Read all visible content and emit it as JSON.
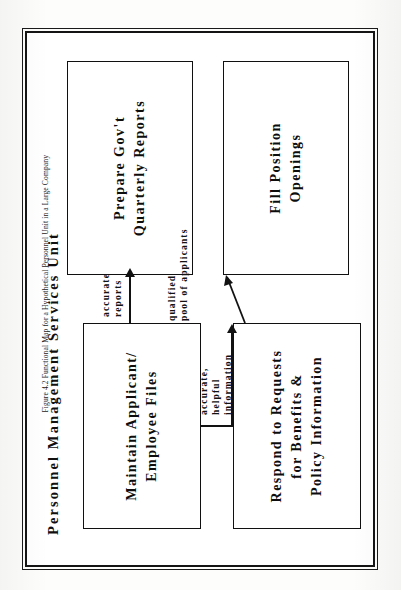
{
  "figure": {
    "unit_title": "Personnel Management Services Unit",
    "caption_number": "Figure 4.2",
    "caption_text": "Functional Map for a Hypothetical Personnel Unit in a Large Company",
    "caption_full": "Figure 4.2   Functional Map for a Hypothetical Personnel Unit in a Large Company",
    "boxes": [
      {
        "id": "maintain",
        "label": "Maintain Applicant/\nEmployee Files",
        "position": "top-left"
      },
      {
        "id": "reports",
        "label": "Prepare  Gov't\nQuarterly  Reports",
        "position": "top-right"
      },
      {
        "id": "respond",
        "label": "Respond  to  Requests\nfor  Benefits  &\nPolicy  Information",
        "position": "bottom-left"
      },
      {
        "id": "fill",
        "label": "Fill  Position\nOpenings",
        "position": "bottom-right"
      }
    ],
    "connectors": [
      {
        "id": "c1",
        "from": "maintain",
        "to": "reports",
        "label": "accurate\nreports"
      },
      {
        "id": "c2",
        "from": "maintain",
        "to": "fill",
        "label": "qualified\npool  of  applicants"
      },
      {
        "id": "c3",
        "from": "maintain",
        "to": "respond",
        "label": "accurate,\nhelpful\ninformation"
      }
    ],
    "colors": {
      "ink": "#111111",
      "page": "#fdfdfc",
      "rule": "#141414"
    }
  }
}
